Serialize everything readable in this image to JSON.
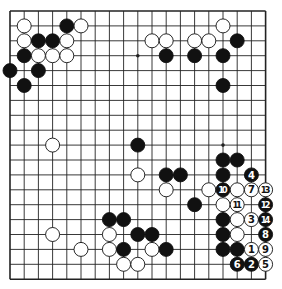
{
  "diagram": {
    "type": "go-board",
    "size": 19,
    "colors": {
      "black": "#111111",
      "white": "#ffffff",
      "line": "#222222",
      "background": "#ffffff"
    },
    "star_points": [
      [
        9,
        3
      ],
      [
        9,
        9
      ],
      [
        15,
        9
      ]
    ],
    "stones": [
      {
        "c": 1,
        "r": 1,
        "color": "white"
      },
      {
        "c": 4,
        "r": 1,
        "color": "black"
      },
      {
        "c": 5,
        "r": 1,
        "color": "white"
      },
      {
        "c": 1,
        "r": 2,
        "color": "white"
      },
      {
        "c": 2,
        "r": 2,
        "color": "black"
      },
      {
        "c": 3,
        "r": 2,
        "color": "black"
      },
      {
        "c": 4,
        "r": 2,
        "color": "white"
      },
      {
        "c": 1,
        "r": 3,
        "color": "black"
      },
      {
        "c": 2,
        "r": 3,
        "color": "white"
      },
      {
        "c": 3,
        "r": 3,
        "color": "white"
      },
      {
        "c": 4,
        "r": 3,
        "color": "white"
      },
      {
        "c": 0,
        "r": 4,
        "color": "black"
      },
      {
        "c": 2,
        "r": 4,
        "color": "black"
      },
      {
        "c": 1,
        "r": 5,
        "color": "black"
      },
      {
        "c": 15,
        "r": 1,
        "color": "white"
      },
      {
        "c": 10,
        "r": 2,
        "color": "white"
      },
      {
        "c": 11,
        "r": 2,
        "color": "white"
      },
      {
        "c": 13,
        "r": 2,
        "color": "white"
      },
      {
        "c": 14,
        "r": 2,
        "color": "white"
      },
      {
        "c": 16,
        "r": 2,
        "color": "black"
      },
      {
        "c": 11,
        "r": 3,
        "color": "black"
      },
      {
        "c": 13,
        "r": 3,
        "color": "black"
      },
      {
        "c": 15,
        "r": 3,
        "color": "black"
      },
      {
        "c": 15,
        "r": 5,
        "color": "black"
      },
      {
        "c": 3,
        "r": 9,
        "color": "white"
      },
      {
        "c": 9,
        "r": 9,
        "color": "black"
      },
      {
        "c": 15,
        "r": 10,
        "color": "black"
      },
      {
        "c": 16,
        "r": 10,
        "color": "black"
      },
      {
        "c": 9,
        "r": 11,
        "color": "white"
      },
      {
        "c": 11,
        "r": 11,
        "color": "black"
      },
      {
        "c": 12,
        "r": 11,
        "color": "black"
      },
      {
        "c": 15,
        "r": 11,
        "color": "black"
      },
      {
        "c": 17,
        "r": 11,
        "color": "black",
        "label": "4"
      },
      {
        "c": 11,
        "r": 12,
        "color": "white"
      },
      {
        "c": 14,
        "r": 12,
        "color": "white"
      },
      {
        "c": 15,
        "r": 12,
        "color": "black",
        "label": "10"
      },
      {
        "c": 16,
        "r": 12,
        "color": "white"
      },
      {
        "c": 17,
        "r": 12,
        "color": "white",
        "label": "7"
      },
      {
        "c": 18,
        "r": 12,
        "color": "white",
        "label": "13"
      },
      {
        "c": 13,
        "r": 13,
        "color": "black"
      },
      {
        "c": 15,
        "r": 13,
        "color": "white"
      },
      {
        "c": 16,
        "r": 13,
        "color": "white",
        "label": "11"
      },
      {
        "c": 18,
        "r": 13,
        "color": "black",
        "label": "12"
      },
      {
        "c": 7,
        "r": 14,
        "color": "black"
      },
      {
        "c": 8,
        "r": 14,
        "color": "black"
      },
      {
        "c": 15,
        "r": 14,
        "color": "black"
      },
      {
        "c": 16,
        "r": 14,
        "color": "white"
      },
      {
        "c": 17,
        "r": 14,
        "color": "white",
        "label": "3"
      },
      {
        "c": 18,
        "r": 14,
        "color": "black",
        "label": "14"
      },
      {
        "c": 3,
        "r": 15,
        "color": "white"
      },
      {
        "c": 7,
        "r": 15,
        "color": "white"
      },
      {
        "c": 9,
        "r": 15,
        "color": "black"
      },
      {
        "c": 10,
        "r": 15,
        "color": "black"
      },
      {
        "c": 15,
        "r": 15,
        "color": "black"
      },
      {
        "c": 16,
        "r": 15,
        "color": "white"
      },
      {
        "c": 18,
        "r": 15,
        "color": "black",
        "label": "8"
      },
      {
        "c": 5,
        "r": 16,
        "color": "white"
      },
      {
        "c": 7,
        "r": 16,
        "color": "white"
      },
      {
        "c": 8,
        "r": 16,
        "color": "black"
      },
      {
        "c": 10,
        "r": 16,
        "color": "white"
      },
      {
        "c": 11,
        "r": 16,
        "color": "black"
      },
      {
        "c": 15,
        "r": 16,
        "color": "black"
      },
      {
        "c": 16,
        "r": 16,
        "color": "black"
      },
      {
        "c": 17,
        "r": 16,
        "color": "white",
        "label": "1"
      },
      {
        "c": 18,
        "r": 16,
        "color": "white",
        "label": "9"
      },
      {
        "c": 8,
        "r": 17,
        "color": "white"
      },
      {
        "c": 9,
        "r": 17,
        "color": "white"
      },
      {
        "c": 16,
        "r": 17,
        "color": "black",
        "label": "6"
      },
      {
        "c": 17,
        "r": 17,
        "color": "black",
        "label": "2"
      },
      {
        "c": 18,
        "r": 17,
        "color": "white",
        "label": "5"
      }
    ]
  }
}
